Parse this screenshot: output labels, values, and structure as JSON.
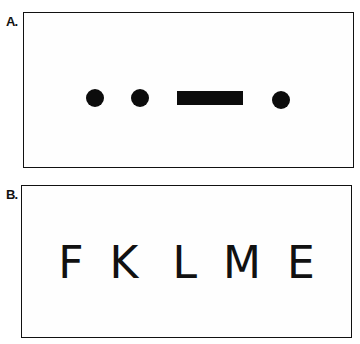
{
  "panels": [
    {
      "label": "A.",
      "content_type": "morse",
      "symbols": [
        "dot",
        "dot",
        "dash",
        "dot"
      ]
    },
    {
      "label": "B.",
      "content_type": "letters",
      "letters": [
        "F",
        "K",
        "L",
        "M",
        "E"
      ]
    }
  ]
}
